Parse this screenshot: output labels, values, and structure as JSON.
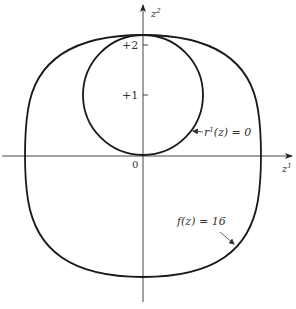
{
  "figure": {
    "type": "level-set diagram",
    "axes": {
      "horizontal_label": "z",
      "horizontal_label_sup": "1",
      "vertical_label": "z",
      "vertical_label_sup": "2",
      "origin_label": "0",
      "ticks": [
        {
          "label": "+1",
          "value": 1
        },
        {
          "label": "+2",
          "value": 2
        }
      ]
    },
    "curves": [
      {
        "name": "inner-circle",
        "label": "r¹(z) = 0",
        "label_pre": "r",
        "label_sup": "1",
        "label_post": "(z) = 0",
        "shape": "circle",
        "center": [
          0,
          1
        ],
        "radius": 1
      },
      {
        "name": "outer-level-curve",
        "label": "f(z) = 16",
        "shape": "superellipse",
        "label_text": "f(z) = 16"
      }
    ],
    "colors": {
      "curve": "#1a1a1a",
      "axis": "#333333",
      "text": "#333333",
      "background": "#ffffff"
    }
  }
}
